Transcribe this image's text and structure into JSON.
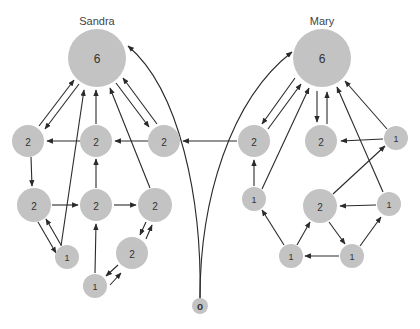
{
  "diagram": {
    "labels": {
      "sandra": "Sandra",
      "mary": "Mary"
    },
    "colors": {
      "node_fill": "#c3c3c3",
      "edge": "#2a2a2a",
      "text": "#333333"
    },
    "origin": {
      "id": "o",
      "label": "o",
      "x": 200,
      "y": 306,
      "r": 8
    },
    "sandra": {
      "nodes": [
        {
          "id": "s6",
          "label": "6",
          "x": 97,
          "y": 58,
          "r": 29
        },
        {
          "id": "s2a",
          "label": "2",
          "x": 28,
          "y": 141,
          "r": 16
        },
        {
          "id": "s2b",
          "label": "2",
          "x": 96,
          "y": 141,
          "r": 16
        },
        {
          "id": "s2c",
          "label": "2",
          "x": 164,
          "y": 141,
          "r": 16
        },
        {
          "id": "s2d",
          "label": "2",
          "x": 34,
          "y": 205,
          "r": 17
        },
        {
          "id": "s2e",
          "label": "2",
          "x": 96,
          "y": 205,
          "r": 16
        },
        {
          "id": "s2f",
          "label": "2",
          "x": 155,
          "y": 205,
          "r": 17
        },
        {
          "id": "s1a",
          "label": "1",
          "x": 67,
          "y": 257,
          "r": 12
        },
        {
          "id": "s2g",
          "label": "2",
          "x": 132,
          "y": 253,
          "r": 16
        },
        {
          "id": "s1b",
          "label": "1",
          "x": 95,
          "y": 286,
          "r": 12
        }
      ]
    },
    "mary": {
      "nodes": [
        {
          "id": "m6",
          "label": "6",
          "x": 322,
          "y": 58,
          "r": 29
        },
        {
          "id": "m2a",
          "label": "2",
          "x": 254,
          "y": 141,
          "r": 16
        },
        {
          "id": "m2b",
          "label": "2",
          "x": 321,
          "y": 141,
          "r": 16
        },
        {
          "id": "m1a",
          "label": "1",
          "x": 396,
          "y": 138,
          "r": 12
        },
        {
          "id": "m1b",
          "label": "1",
          "x": 254,
          "y": 199,
          "r": 12
        },
        {
          "id": "m2c",
          "label": "2",
          "x": 320,
          "y": 206,
          "r": 17
        },
        {
          "id": "m1c",
          "label": "1",
          "x": 389,
          "y": 204,
          "r": 12
        },
        {
          "id": "m1d",
          "label": "1",
          "x": 291,
          "y": 256,
          "r": 12
        },
        {
          "id": "m1e",
          "label": "1",
          "x": 352,
          "y": 256,
          "r": 12
        }
      ]
    }
  }
}
